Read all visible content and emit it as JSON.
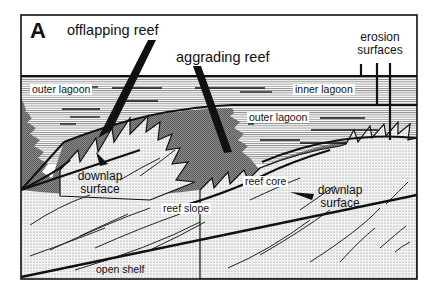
{
  "figure": {
    "panel_letter": "A",
    "type": "geological cross-section",
    "labels": {
      "offlapping_reef": "offlapping reef",
      "aggrading_reef": "aggrading reef",
      "erosion_surfaces_line1": "erosion",
      "erosion_surfaces_line2": "surfaces",
      "outer_lagoon_left": "outer lagoon",
      "inner_lagoon": "inner lagoon",
      "outer_lagoon_right": "outer lagoon",
      "downlap_surface_left_line1": "downlap",
      "downlap_surface_left_line2": "surface",
      "downlap_surface_right_line1": "downlap",
      "downlap_surface_right_line2": "surface",
      "reef_core": "reef core",
      "reef_slope": "reef slope",
      "open_shelf": "open shelf"
    },
    "colors": {
      "frame": "#111111",
      "reef_core_fill": "#7a7a7a",
      "lagoon_hatch": "#444444",
      "slope_dots": "#777777",
      "background": "#ffffff"
    }
  }
}
